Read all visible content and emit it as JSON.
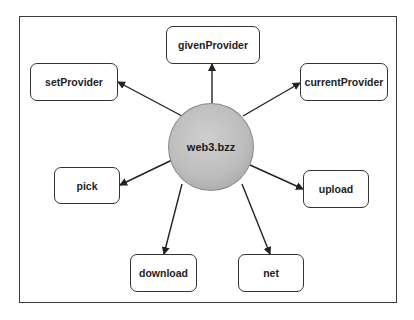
{
  "diagram": {
    "center": {
      "label": "web3.bzz"
    },
    "nodes": [
      {
        "id": "givenProvider",
        "label": "givenProvider"
      },
      {
        "id": "setProvider",
        "label": "setProvider"
      },
      {
        "id": "currentProvider",
        "label": "currentProvider"
      },
      {
        "id": "pick",
        "label": "pick"
      },
      {
        "id": "upload",
        "label": "upload"
      },
      {
        "id": "download",
        "label": "download"
      },
      {
        "id": "net",
        "label": "net"
      }
    ],
    "edges": [
      {
        "from": "web3.bzz",
        "to": "givenProvider"
      },
      {
        "from": "web3.bzz",
        "to": "setProvider"
      },
      {
        "from": "web3.bzz",
        "to": "currentProvider"
      },
      {
        "from": "web3.bzz",
        "to": "pick"
      },
      {
        "from": "web3.bzz",
        "to": "upload"
      },
      {
        "from": "web3.bzz",
        "to": "download"
      },
      {
        "from": "web3.bzz",
        "to": "net"
      }
    ],
    "colors": {
      "hub_fill": "#bdbdbd",
      "stroke": "#333333",
      "background": "#ffffff"
    }
  }
}
